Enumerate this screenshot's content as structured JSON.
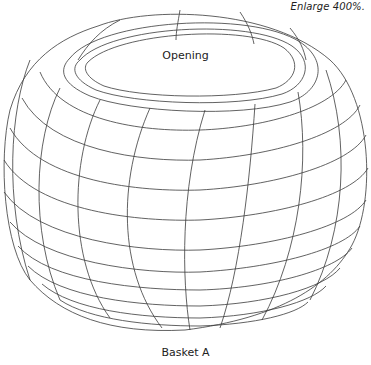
{
  "figure": {
    "enlarge_note": "Enlarge 400%.",
    "opening_label": "Opening",
    "caption": "Basket A",
    "caption_sub": "(cropped text)"
  },
  "colors": {
    "line": "#3a3a3a",
    "text": "#222222",
    "background": "#ffffff"
  },
  "drawing": {
    "subject": "basket-wireframe",
    "meridian_count": 9,
    "parallel_count": 11,
    "rim_rings": 3
  }
}
